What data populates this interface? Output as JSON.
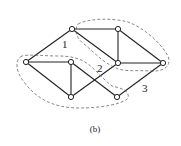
{
  "diagram": {
    "nodes": [
      {
        "id": "A",
        "x": 26,
        "y": 62
      },
      {
        "id": "B",
        "x": 72,
        "y": 29
      },
      {
        "id": "C",
        "x": 71,
        "y": 62
      },
      {
        "id": "D",
        "x": 71,
        "y": 97
      },
      {
        "id": "E",
        "x": 118,
        "y": 29
      },
      {
        "id": "F",
        "x": 118,
        "y": 63
      },
      {
        "id": "G",
        "x": 117,
        "y": 97
      },
      {
        "id": "H",
        "x": 163,
        "y": 63
      }
    ],
    "edges": [
      [
        "A",
        "B"
      ],
      [
        "A",
        "C"
      ],
      [
        "A",
        "D"
      ],
      [
        "B",
        "E"
      ],
      [
        "B",
        "F"
      ],
      [
        "C",
        "D"
      ],
      [
        "C",
        "G"
      ],
      [
        "D",
        "F"
      ],
      [
        "E",
        "F"
      ],
      [
        "E",
        "H"
      ],
      [
        "F",
        "H"
      ],
      [
        "G",
        "H"
      ]
    ],
    "region_labels": [
      {
        "text": "1",
        "x": 62,
        "y": 48
      },
      {
        "text": "2",
        "x": 97,
        "y": 72
      },
      {
        "text": "3",
        "x": 142,
        "y": 92
      }
    ],
    "caption": "(b)"
  }
}
